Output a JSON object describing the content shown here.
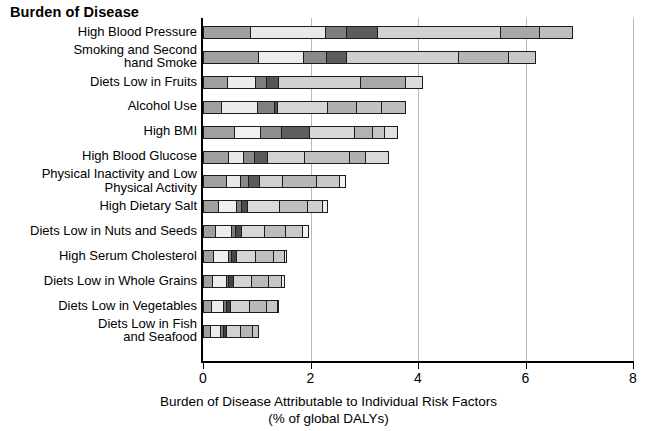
{
  "chart_title": "Burden of Disease",
  "axis": {
    "x_title_line1": "Burden of Disease Attributable to Individual Risk Factors",
    "x_title_line2": "(% of global DALYs)",
    "x_ticks": [
      "0",
      "2",
      "4",
      "6",
      "8"
    ],
    "x_tick_values": [
      0,
      2,
      4,
      6,
      8
    ],
    "xlim": [
      0,
      8
    ]
  },
  "chart_data": {
    "type": "bar",
    "orientation": "horizontal",
    "stacked": true,
    "title": "Burden of Disease",
    "xlabel": "Burden of Disease Attributable to Individual Risk Factors (% of global DALYs)",
    "ylabel": "",
    "xlim": [
      0,
      8
    ],
    "ylim": null,
    "grid": "vertical gridlines at x = 2, 4, 6, 8",
    "legend": "none",
    "categories": [
      "High Blood Pressure",
      "Smoking and Second hand Smoke",
      "Diets Low in Fruits",
      "Alcohol Use",
      "High BMI",
      "High Blood Glucose",
      "Physical Inactivity and Low Physical Activity",
      "High Dietary Salt",
      "Diets Low in Nuts and Seeds",
      "High Serum Cholesterol",
      "Diets Low in Whole Grains",
      "Diets Low in Vegetables",
      "Diets Low in Fish and Seafood"
    ],
    "category_labels_wrapped": [
      "High Blood Pressure",
      "Smoking and Second\nhand Smoke",
      "Diets Low in Fruits",
      "Alcohol Use",
      "High BMI",
      "High Blood Glucose",
      "Physical Inactivity and Low\nPhysical Activity",
      "High Dietary Salt",
      "Diets Low in Nuts and Seeds",
      "High Serum Cholesterol",
      "Diets Low in Whole Grains",
      "Diets Low in Vegetables",
      "Diets Low in Fish\nand Seafood"
    ],
    "totals": [
      7.0,
      6.3,
      4.2,
      3.9,
      3.75,
      3.6,
      2.8,
      2.45,
      2.1,
      1.7,
      1.65,
      1.55,
      1.15
    ],
    "segments": [
      {
        "category": "High Blood Pressure",
        "values": [
          0.9,
          1.4,
          0.42,
          0.6,
          2.3,
          0.75,
          0.63
        ],
        "shades": [
          "#9f9f9f",
          "#e8e8e8",
          "#7d7d7d",
          "#5c5c5c",
          "#d2d2d2",
          "#a8a8a8",
          "#bdbdbd"
        ]
      },
      {
        "category": "Smoking and Second hand Smoke",
        "values": [
          1.05,
          0.85,
          0.45,
          0.38,
          2.1,
          0.95,
          0.52
        ],
        "shades": [
          "#9f9f9f",
          "#ececec",
          "#8a8a8a",
          "#5c5c5c",
          "#cfcfcf",
          "#b5b5b5",
          "#c8c8c8"
        ]
      },
      {
        "category": "Diets Low in Fruits",
        "values": [
          0.47,
          0.53,
          0.22,
          0.25,
          1.55,
          0.85,
          0.33
        ],
        "shades": [
          "#9f9f9f",
          "#ececec",
          "#7d7d7d",
          "#555555",
          "#d0d0d0",
          "#a8a8a8",
          "#dcdcdc"
        ]
      },
      {
        "category": "Alcohol Use",
        "values": [
          0.35,
          0.7,
          0.32,
          0.08,
          0.95,
          0.55,
          0.5,
          0.45
        ],
        "shades": [
          "#9f9f9f",
          "#ececec",
          "#808080",
          "#4d4d4d",
          "#d6d6d6",
          "#b0b0b0",
          "#c2c2c2",
          "#bdbdbd"
        ]
      },
      {
        "category": "High BMI",
        "values": [
          0.6,
          0.5,
          0.4,
          0.55,
          0.85,
          0.35,
          0.25,
          0.25
        ],
        "shades": [
          "#9f9f9f",
          "#f0f0f0",
          "#8d8d8d",
          "#5e5e5e",
          "#d8d8d8",
          "#b3b3b3",
          "#c6c6c6",
          "#e0e0e0"
        ]
      },
      {
        "category": "High Blood Glucose",
        "values": [
          0.48,
          0.3,
          0.22,
          0.27,
          0.7,
          0.85,
          0.33,
          0.45
        ],
        "shades": [
          "#9f9f9f",
          "#e8e8e8",
          "#8a8a8a",
          "#5a5a5a",
          "#d2d2d2",
          "#c0c0c0",
          "#b0b0b0",
          "#d9d9d9"
        ]
      },
      {
        "category": "Physical Inactivity and Low Physical Activity",
        "values": [
          0.45,
          0.28,
          0.17,
          0.22,
          0.45,
          0.65,
          0.45,
          0.13
        ],
        "shades": [
          "#9f9f9f",
          "#e8e8e8",
          "#8a8a8a",
          "#5a5a5a",
          "#d0d0d0",
          "#b6b6b6",
          "#c8c8c8",
          "#f2f2f2"
        ]
      },
      {
        "category": "High Dietary Salt",
        "values": [
          0.3,
          0.35,
          0.12,
          0.13,
          0.6,
          0.55,
          0.3,
          0.1
        ],
        "shades": [
          "#9f9f9f",
          "#efefef",
          "#7d7d7d",
          "#4d4d4d",
          "#dadada",
          "#bfbfbf",
          "#cfcfcf",
          "#ededed"
        ]
      },
      {
        "category": "Diets Low in Nuts and Seeds",
        "values": [
          0.25,
          0.3,
          0.1,
          0.13,
          0.45,
          0.4,
          0.35,
          0.12
        ],
        "shades": [
          "#9f9f9f",
          "#eeeeee",
          "#7d7d7d",
          "#4a4a4a",
          "#d7d7d7",
          "#bcbcbc",
          "#c9c9c9",
          "#f0f0f0"
        ]
      },
      {
        "category": "High Serum Cholesterol",
        "values": [
          0.2,
          0.3,
          0.08,
          0.1,
          0.38,
          0.35,
          0.23,
          0.06
        ],
        "shades": [
          "#9f9f9f",
          "#efefef",
          "#7a7a7a",
          "#464646",
          "#d5d5d5",
          "#bdbdbd",
          "#c8c8c8",
          "#f0f0f0"
        ]
      },
      {
        "category": "Diets Low in Whole Grains",
        "values": [
          0.18,
          0.28,
          0.07,
          0.1,
          0.35,
          0.35,
          0.26,
          0.06
        ],
        "shades": [
          "#9f9f9f",
          "#ededed",
          "#787878",
          "#444444",
          "#d4d4d4",
          "#bababa",
          "#c6c6c6",
          "#efefef"
        ]
      },
      {
        "category": "Diets Low in Vegetables",
        "values": [
          0.16,
          0.25,
          0.07,
          0.1,
          0.36,
          0.35,
          0.21,
          0.05
        ],
        "shades": [
          "#9f9f9f",
          "#ededed",
          "#787878",
          "#414141",
          "#d3d3d3",
          "#b9b9b9",
          "#c5c5c5",
          "#eeeeee"
        ]
      },
      {
        "category": "Diets Low in Fish and Seafood",
        "values": [
          0.14,
          0.22,
          0.06,
          0.08,
          0.28,
          0.25,
          0.12
        ],
        "shades": [
          "#9f9f9f",
          "#ececec",
          "#757575",
          "#3f3f3f",
          "#d2d2d2",
          "#b6b6b6",
          "#c3c3c3"
        ]
      }
    ]
  },
  "colors": {
    "background": "#ffffff",
    "axis": "#000000",
    "gridline": "#b9b9b9",
    "bar_outline": "#1c1c1c"
  }
}
